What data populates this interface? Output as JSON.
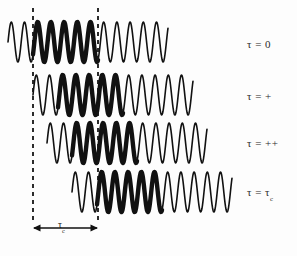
{
  "figure": {
    "background_color": "#fdfdfd",
    "stroke_color": "#111111",
    "width": 297,
    "height": 256
  },
  "labels": {
    "row0": "τ = 0",
    "row1": "τ = +",
    "row2": "τ = ++",
    "row3_prefix": "τ = τ",
    "row3_sub": "c"
  },
  "bracket": {
    "label_prefix": "τ",
    "label_sub": "c",
    "left_x": 33,
    "right_x": 98,
    "y": 228
  },
  "guides": {
    "dashed_lines": [
      {
        "name": "left-guide",
        "x": 33,
        "y_top": 8,
        "y_bottom": 222
      },
      {
        "name": "right-guide",
        "x": 98,
        "y_top": 8,
        "y_bottom": 222
      }
    ],
    "dash_pattern": "4 4",
    "dash_width": 1.8,
    "dash_color": "#151515"
  },
  "chart_data": {
    "type": "line",
    "xlabel": "",
    "ylabel": "",
    "grid": false,
    "legend_position": "right",
    "annotations": [
      {
        "text": "τ = 0",
        "at_row": 0
      },
      {
        "text": "τ = +",
        "at_row": 1
      },
      {
        "text": "τ = ++",
        "at_row": 2
      },
      {
        "text": "τ = τc",
        "at_row": 3
      },
      {
        "text": "τc",
        "type": "double-arrow",
        "from_x": 33,
        "to_x": 98,
        "y": 228
      }
    ],
    "series": [
      {
        "name": "tau = 0",
        "baseline_y": 42,
        "amplitude": 20,
        "period": 13.2,
        "phase": 0.0,
        "x_start": 8,
        "x_end": 168,
        "bold_from": 33,
        "bold_to": 98,
        "thin_width": 1.6,
        "bold_width": 4.4
      },
      {
        "name": "tau = +",
        "baseline_y": 95,
        "amplitude": 20,
        "period": 13.2,
        "phase": 0.0,
        "x_start": 33,
        "x_end": 193,
        "bold_from": 58,
        "bold_to": 123,
        "thin_width": 1.6,
        "bold_width": 4.4
      },
      {
        "name": "tau = ++",
        "baseline_y": 143,
        "amplitude": 20,
        "period": 13.2,
        "phase": 0.0,
        "x_start": 47,
        "x_end": 207,
        "bold_from": 72,
        "bold_to": 137,
        "thin_width": 1.6,
        "bold_width": 4.4
      },
      {
        "name": "tau = tau_c",
        "baseline_y": 192,
        "amplitude": 20,
        "period": 13.2,
        "phase": 0.0,
        "x_start": 72,
        "x_end": 232,
        "bold_from": 97,
        "bold_to": 162,
        "thin_width": 1.6,
        "bold_width": 4.4
      }
    ]
  }
}
